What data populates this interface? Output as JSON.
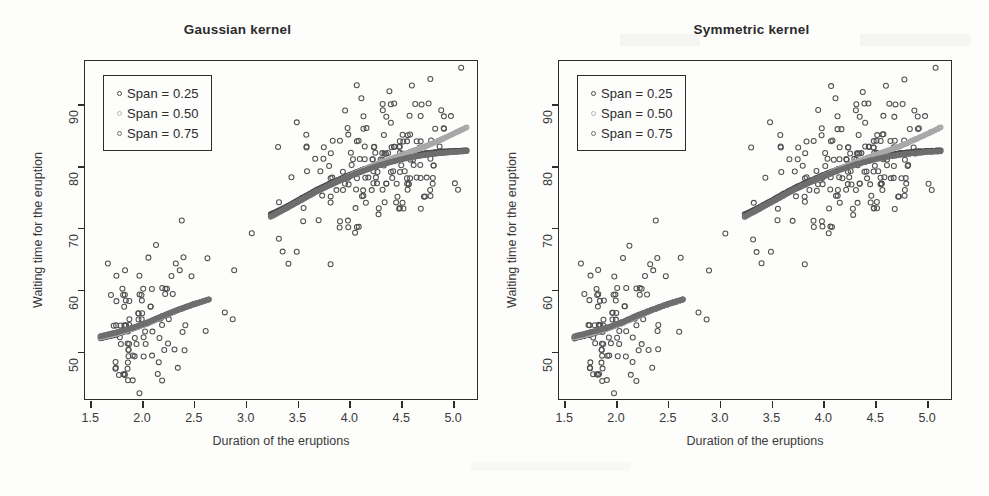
{
  "figure": {
    "axis_title_x": "Duration of the eruptions",
    "axis_title_y": "Waiting time for the eruption"
  },
  "panels": [
    {
      "id": "left",
      "title": "Gaussian kernel"
    },
    {
      "id": "right",
      "title": "Symmetric kernel"
    }
  ],
  "legend": {
    "entries": [
      {
        "label": "Span = 0.25",
        "color": "#4a4a4a"
      },
      {
        "label": "Span = 0.50",
        "color": "#a8a8a8"
      },
      {
        "label": "Span = 0.75",
        "color": "#6e6e6e"
      }
    ]
  },
  "axes": {
    "x_ticks": [
      "1.5",
      "2.0",
      "2.5",
      "3.0",
      "3.5",
      "4.0",
      "4.5",
      "5.0"
    ],
    "y_ticks": [
      "50",
      "60",
      "70",
      "80",
      "90"
    ],
    "xlim": [
      1.45,
      5.25
    ],
    "ylim": [
      42,
      97
    ]
  },
  "chart_data": {
    "type": "scatter",
    "xlabel": "Duration of the eruptions",
    "ylabel": "Waiting time for the eruption",
    "xlim": [
      1.45,
      5.25
    ],
    "ylim": [
      42,
      97
    ],
    "grid": false,
    "legend_position": "top-left",
    "panels": [
      {
        "name": "Gaussian kernel"
      },
      {
        "name": "Symmetric kernel"
      }
    ],
    "point_color": "#4f4f4f",
    "point_marker": "open-circle",
    "points": [
      [
        3.6,
        79
      ],
      [
        1.8,
        54
      ],
      [
        3.333,
        74
      ],
      [
        2.283,
        62
      ],
      [
        4.533,
        85
      ],
      [
        2.883,
        55
      ],
      [
        4.7,
        88
      ],
      [
        3.6,
        85
      ],
      [
        1.95,
        51
      ],
      [
        4.35,
        85
      ],
      [
        1.833,
        54
      ],
      [
        3.917,
        84
      ],
      [
        4.2,
        78
      ],
      [
        1.75,
        47
      ],
      [
        4.7,
        83
      ],
      [
        2.167,
        52
      ],
      [
        1.75,
        62
      ],
      [
        4.8,
        84
      ],
      [
        1.6,
        52
      ],
      [
        4.25,
        79
      ],
      [
        1.8,
        51
      ],
      [
        1.75,
        47
      ],
      [
        3.45,
        78
      ],
      [
        3.067,
        69
      ],
      [
        4.533,
        74
      ],
      [
        3.6,
        83
      ],
      [
        1.967,
        55
      ],
      [
        4.083,
        76
      ],
      [
        3.85,
        78
      ],
      [
        4.433,
        79
      ],
      [
        4.3,
        73
      ],
      [
        4.467,
        77
      ],
      [
        3.367,
        66
      ],
      [
        4.033,
        80
      ],
      [
        3.833,
        74
      ],
      [
        2.017,
        52
      ],
      [
        1.867,
        48
      ],
      [
        4.833,
        80
      ],
      [
        1.833,
        59
      ],
      [
        4.783,
        90
      ],
      [
        4.35,
        80
      ],
      [
        1.883,
        58
      ],
      [
        4.567,
        84
      ],
      [
        1.75,
        58
      ],
      [
        4.533,
        73
      ],
      [
        3.317,
        83
      ],
      [
        3.833,
        64
      ],
      [
        2.1,
        53
      ],
      [
        4.633,
        82
      ],
      [
        2.0,
        59
      ],
      [
        4.8,
        75
      ],
      [
        4.716,
        90
      ],
      [
        1.833,
        54
      ],
      [
        4.833,
        80
      ],
      [
        1.733,
        54
      ],
      [
        4.883,
        83
      ],
      [
        3.717,
        71
      ],
      [
        1.667,
        64
      ],
      [
        4.567,
        77
      ],
      [
        4.317,
        81
      ],
      [
        2.233,
        59
      ],
      [
        4.5,
        84
      ],
      [
        1.75,
        48
      ],
      [
        4.8,
        82
      ],
      [
        1.817,
        60
      ],
      [
        4.4,
        92
      ],
      [
        4.167,
        78
      ],
      [
        4.7,
        78
      ],
      [
        2.067,
        65
      ],
      [
        4.7,
        73
      ],
      [
        4.033,
        82
      ],
      [
        1.967,
        56
      ],
      [
        4.5,
        79
      ],
      [
        4.0,
        71
      ],
      [
        1.983,
        62
      ],
      [
        5.067,
        76
      ],
      [
        2.017,
        60
      ],
      [
        4.567,
        78
      ],
      [
        3.883,
        76
      ],
      [
        3.6,
        83
      ],
      [
        4.133,
        75
      ],
      [
        4.333,
        82
      ],
      [
        4.1,
        70
      ],
      [
        2.633,
        65
      ],
      [
        4.067,
        73
      ],
      [
        4.933,
        88
      ],
      [
        3.95,
        76
      ],
      [
        4.517,
        80
      ],
      [
        2.167,
        48
      ],
      [
        4.0,
        86
      ],
      [
        2.2,
        60
      ],
      [
        4.333,
        90
      ],
      [
        1.867,
        50
      ],
      [
        4.817,
        78
      ],
      [
        1.833,
        63
      ],
      [
        4.3,
        72
      ],
      [
        4.667,
        84
      ],
      [
        3.75,
        75
      ],
      [
        1.867,
        51
      ],
      [
        4.9,
        82
      ],
      [
        2.483,
        62
      ],
      [
        4.367,
        88
      ],
      [
        2.1,
        49
      ],
      [
        4.5,
        83
      ],
      [
        4.05,
        81
      ],
      [
        1.867,
        47
      ],
      [
        4.7,
        84
      ],
      [
        1.783,
        52
      ],
      [
        4.85,
        86
      ],
      [
        3.683,
        81
      ],
      [
        4.733,
        75
      ],
      [
        2.3,
        59
      ],
      [
        4.9,
        89
      ],
      [
        4.417,
        79
      ],
      [
        1.7,
        59
      ],
      [
        4.633,
        81
      ],
      [
        2.317,
        50
      ],
      [
        4.6,
        85
      ],
      [
        1.817,
        59
      ],
      [
        4.417,
        87
      ],
      [
        2.617,
        53
      ],
      [
        4.067,
        69
      ],
      [
        4.25,
        77
      ],
      [
        1.967,
        56
      ],
      [
        4.6,
        88
      ],
      [
        3.767,
        81
      ],
      [
        1.917,
        45
      ],
      [
        4.5,
        82
      ],
      [
        2.267,
        55
      ],
      [
        4.65,
        90
      ],
      [
        1.867,
        45
      ],
      [
        4.167,
        83
      ],
      [
        2.8,
        56
      ],
      [
        4.333,
        89
      ],
      [
        1.833,
        46
      ],
      [
        4.383,
        82
      ],
      [
        1.883,
        51
      ],
      [
        4.933,
        86
      ],
      [
        2.033,
        53
      ],
      [
        3.733,
        79
      ],
      [
        4.233,
        81
      ],
      [
        2.233,
        60
      ],
      [
        4.533,
        82
      ],
      [
        4.817,
        77
      ],
      [
        4.333,
        76
      ],
      [
        1.983,
        59
      ],
      [
        4.633,
        80
      ],
      [
        2.017,
        49
      ],
      [
        5.1,
        96
      ],
      [
        1.8,
        53
      ],
      [
        5.033,
        77
      ],
      [
        4.0,
        77
      ],
      [
        2.4,
        65
      ],
      [
        4.6,
        81
      ],
      [
        3.567,
        71
      ],
      [
        4.0,
        70
      ],
      [
        4.5,
        81
      ],
      [
        4.083,
        93
      ],
      [
        1.8,
        53
      ],
      [
        3.967,
        89
      ],
      [
        2.2,
        45
      ],
      [
        4.15,
        86
      ],
      [
        2.0,
        58
      ],
      [
        3.833,
        78
      ],
      [
        3.5,
        66
      ],
      [
        4.583,
        76
      ],
      [
        2.367,
        63
      ],
      [
        5.0,
        88
      ],
      [
        1.933,
        52
      ],
      [
        4.617,
        93
      ],
      [
        1.917,
        49
      ],
      [
        2.083,
        57
      ],
      [
        4.583,
        77
      ],
      [
        3.333,
        68
      ],
      [
        4.167,
        81
      ],
      [
        4.333,
        81
      ],
      [
        4.5,
        73
      ],
      [
        2.417,
        50
      ],
      [
        4.0,
        85
      ],
      [
        4.167,
        74
      ],
      [
        1.883,
        55
      ],
      [
        4.583,
        77
      ],
      [
        4.25,
        83
      ],
      [
        3.767,
        83
      ],
      [
        2.033,
        51
      ],
      [
        4.433,
        78
      ],
      [
        4.083,
        84
      ],
      [
        1.833,
        46
      ],
      [
        4.417,
        83
      ],
      [
        2.183,
        55
      ],
      [
        4.8,
        81
      ],
      [
        1.833,
        57
      ],
      [
        4.8,
        76
      ],
      [
        4.1,
        84
      ],
      [
        3.966,
        77
      ],
      [
        4.233,
        81
      ],
      [
        3.5,
        87
      ],
      [
        4.366,
        77
      ],
      [
        2.25,
        51
      ],
      [
        4.667,
        78
      ],
      [
        2.1,
        60
      ],
      [
        4.35,
        82
      ],
      [
        4.133,
        91
      ],
      [
        1.867,
        53
      ],
      [
        4.6,
        78
      ],
      [
        1.783,
        46
      ],
      [
        4.367,
        77
      ],
      [
        3.85,
        84
      ],
      [
        1.933,
        49
      ],
      [
        4.5,
        83
      ],
      [
        2.383,
        71
      ],
      [
        4.7,
        80
      ],
      [
        1.867,
        49
      ],
      [
        3.833,
        75
      ],
      [
        3.417,
        64
      ],
      [
        4.233,
        76
      ],
      [
        2.4,
        53
      ],
      [
        4.8,
        94
      ],
      [
        2.0,
        55
      ],
      [
        4.15,
        76
      ],
      [
        1.867,
        50
      ],
      [
        4.267,
        82
      ],
      [
        1.75,
        54
      ],
      [
        4.483,
        75
      ],
      [
        4.0,
        78
      ],
      [
        4.117,
        79
      ],
      [
        4.083,
        78
      ],
      [
        4.267,
        78
      ],
      [
        3.917,
        70
      ],
      [
        4.55,
        79
      ],
      [
        4.083,
        70
      ],
      [
        2.417,
        54
      ],
      [
        4.183,
        86
      ],
      [
        2.217,
        50
      ],
      [
        4.45,
        90
      ],
      [
        1.883,
        54
      ],
      [
        1.85,
        54
      ],
      [
        4.283,
        77
      ],
      [
        3.95,
        79
      ],
      [
        2.333,
        64
      ],
      [
        4.15,
        75
      ],
      [
        2.35,
        47
      ],
      [
        4.933,
        86
      ],
      [
        2.9,
        63
      ],
      [
        4.583,
        85
      ],
      [
        3.833,
        82
      ],
      [
        2.083,
        57
      ],
      [
        4.367,
        82
      ],
      [
        2.133,
        67
      ],
      [
        4.35,
        74
      ],
      [
        2.2,
        54
      ],
      [
        4.45,
        83
      ],
      [
        3.567,
        73
      ],
      [
        4.5,
        73
      ],
      [
        4.15,
        88
      ],
      [
        3.817,
        80
      ],
      [
        3.917,
        71
      ],
      [
        4.45,
        83
      ],
      [
        2.0,
        56
      ],
      [
        4.283,
        79
      ],
      [
        4.767,
        78
      ],
      [
        4.533,
        84
      ],
      [
        1.85,
        58
      ],
      [
        4.25,
        83
      ],
      [
        1.983,
        43
      ],
      [
        2.25,
        60
      ],
      [
        4.75,
        75
      ],
      [
        4.117,
        81
      ],
      [
        2.15,
        46
      ],
      [
        4.417,
        90
      ],
      [
        1.817,
        46
      ],
      [
        4.467,
        74
      ]
    ],
    "smooth_curves": [
      {
        "name": "Span = 0.25",
        "color": "#4a4a4a",
        "x": [
          1.6,
          1.75,
          1.9,
          2.05,
          2.2,
          2.35,
          2.5,
          2.65,
          3.25,
          3.4,
          3.55,
          3.7,
          3.85,
          4.0,
          4.15,
          4.3,
          4.45,
          4.6,
          4.75,
          4.9,
          5.05,
          5.15
        ],
        "y": [
          51.8,
          52.4,
          53.3,
          54.2,
          55.3,
          56.4,
          57.3,
          58.1,
          72.0,
          73.2,
          74.6,
          76.0,
          77.2,
          78.3,
          79.3,
          80.2,
          80.9,
          81.5,
          81.9,
          82.2,
          82.3,
          82.4
        ]
      },
      {
        "name": "Span = 0.50",
        "color": "#a8a8a8",
        "x": [
          1.6,
          1.75,
          1.9,
          2.05,
          2.2,
          2.35,
          2.5,
          2.65,
          3.25,
          3.4,
          3.55,
          3.7,
          3.85,
          4.0,
          4.15,
          4.3,
          4.45,
          4.6,
          4.75,
          4.9,
          5.05,
          5.15
        ],
        "y": [
          52.0,
          52.6,
          53.4,
          54.3,
          55.4,
          56.5,
          57.4,
          58.2,
          71.6,
          73.0,
          74.4,
          75.8,
          77.0,
          78.2,
          79.3,
          80.4,
          81.3,
          82.2,
          83.1,
          84.2,
          85.4,
          86.2
        ]
      },
      {
        "name": "Span = 0.75",
        "color": "#6e6e6e",
        "x": [
          1.6,
          1.75,
          1.9,
          2.05,
          2.2,
          2.35,
          2.5,
          2.65,
          3.25,
          3.4,
          3.55,
          3.7,
          3.85,
          4.0,
          4.15,
          4.3,
          4.45,
          4.6,
          4.75,
          4.9,
          5.05,
          5.15
        ],
        "y": [
          52.3,
          52.9,
          53.6,
          54.5,
          55.6,
          56.6,
          57.5,
          58.3,
          71.8,
          73.1,
          74.5,
          75.9,
          77.1,
          78.2,
          79.2,
          80.1,
          80.8,
          81.4,
          81.8,
          82.1,
          82.3,
          82.4
        ]
      }
    ]
  }
}
